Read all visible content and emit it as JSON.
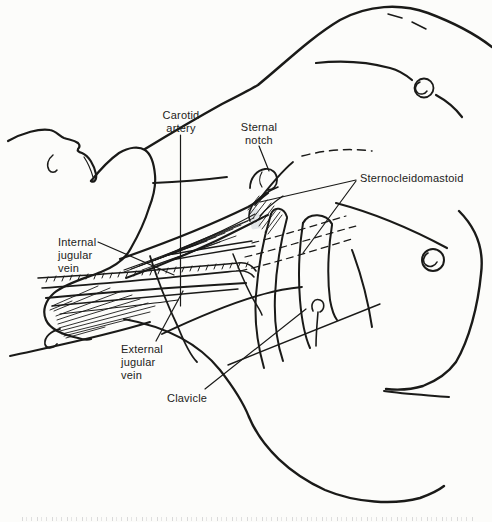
{
  "figure": {
    "labels": {
      "carotid_artery": {
        "lines": [
          "Carotid",
          "artery"
        ]
      },
      "sternal_notch": {
        "lines": [
          "Sternal",
          "notch"
        ]
      },
      "sternocleidomastoid": {
        "lines": [
          "Sternocleidomastoid"
        ]
      },
      "internal_jugular_vein": {
        "lines": [
          "Internal",
          "jugular",
          "vein"
        ]
      },
      "external_jugular_vein": {
        "lines": [
          "External",
          "jugular",
          "vein"
        ]
      },
      "clavicle": {
        "lines": [
          "Clavicle"
        ]
      }
    },
    "colors": {
      "ink": "#1a1a18",
      "paper": "#fcfcfa",
      "highlight": "#ccd3d8"
    }
  }
}
